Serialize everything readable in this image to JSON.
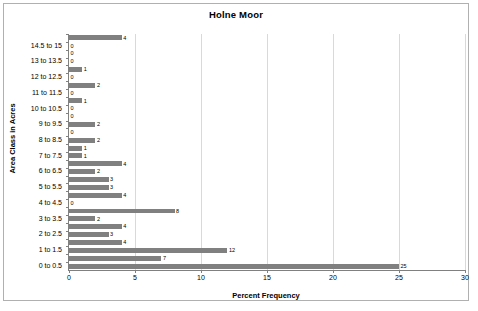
{
  "chart_data": {
    "type": "bar",
    "orientation": "horizontal",
    "title": "Holne Moor",
    "xlabel": "Percent Frequency",
    "ylabel": "Area Class in Acres",
    "xlim": [
      0,
      30
    ],
    "xticks": [
      0,
      5,
      10,
      15,
      20,
      25,
      30
    ],
    "grid": true,
    "legend": false,
    "bar_color": "#808080",
    "categories": [
      "0 to 0.5",
      "0.5 to 1",
      "1 to 1.5",
      "1.5 to 2",
      "2 to 2.5",
      "2.5 to 3",
      "3 to 3.5",
      "3.5 to 4",
      "4 to 4.5",
      "4.5 to 5",
      "5 to 5.5",
      "5.5 to 6",
      "6 to 6.5",
      "6.5 to 7",
      "7 to 7.5",
      "7.5 to 8",
      "8 to 8.5",
      "8.5 to 9",
      "9 to 9.5",
      "9.5 to 10",
      "10 to 10.5",
      "10.5 to 11",
      "11 to 11.5",
      "11.5 to 12",
      "12 to 12.5",
      "12.5 to 13",
      "13 to 13.5",
      "13.5 to 14",
      "14.5 to 15",
      "15 to 15.5"
    ],
    "values": [
      25,
      7,
      12,
      4,
      3,
      4,
      2,
      8,
      0,
      4,
      3,
      3,
      2,
      4,
      1,
      1,
      2,
      0,
      2,
      0,
      0,
      1,
      0,
      2,
      0,
      1,
      0,
      0,
      0,
      4
    ],
    "visible_tick_labels": [
      "14.5 to 15",
      "13 to 13.5",
      "12 to 12.5",
      "11 to 11.5",
      "10 to 10.5",
      "9 to 9.5",
      "8 to 8.5",
      "7 to 7.5",
      "6 to 6.5",
      "5 to 5.5",
      "4 to 4.5",
      "3 to 3.5",
      "2 to 2.5",
      "1 to 1.5",
      "0 to 0.5"
    ],
    "data_labels": [
      "4",
      "0",
      "0",
      "0",
      "1",
      "0",
      "2",
      "0",
      "1",
      "0",
      "0",
      "2",
      "0",
      "2",
      "1",
      "1",
      "4",
      "2",
      "3",
      "3",
      "4",
      "0",
      "8",
      "2",
      "4",
      "3",
      "4",
      "12",
      "7",
      "25"
    ]
  }
}
